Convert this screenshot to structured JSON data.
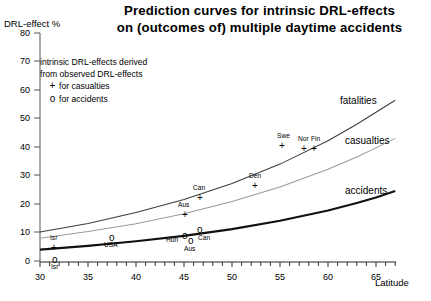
{
  "chart_data": {
    "type": "line",
    "title": "Prediction curves for intrinsic DRL-effects on (outcomes of) multiple daytime accidents",
    "title_line1": "Prediction curves for intrinsic DRL-effects",
    "title_line2": "on (outcomes of) multiple daytime accidents",
    "xlabel": "Latitude",
    "ylabel": "DRL-effect %",
    "xlim": [
      30,
      67
    ],
    "ylim": [
      0,
      80
    ],
    "xticks": [
      30,
      35,
      40,
      45,
      50,
      55,
      60,
      65
    ],
    "yticks": [
      0,
      10,
      20,
      30,
      40,
      50,
      60,
      70,
      80
    ],
    "xtick_minor_step": 1,
    "grid": false,
    "legend_position": "upper-left-inside",
    "series": [
      {
        "name": "fatalities",
        "label": "fatalities",
        "style": "thin-line",
        "x": [
          30,
          35,
          40,
          45,
          50,
          55,
          60,
          63,
          65,
          67
        ],
        "values": [
          10.2,
          13.2,
          17.0,
          21.6,
          27.2,
          34.0,
          42.2,
          48.0,
          52.2,
          56.4
        ]
      },
      {
        "name": "casualties",
        "label": "casualties",
        "style": "light-line",
        "x": [
          30,
          35,
          40,
          45,
          50,
          55,
          60,
          63,
          65,
          67
        ],
        "values": [
          8.0,
          10.3,
          13.1,
          16.6,
          20.9,
          26.0,
          32.2,
          36.5,
          39.7,
          43.0
        ]
      },
      {
        "name": "accidents",
        "label": "accidents",
        "style": "thick-line",
        "x": [
          30,
          35,
          40,
          45,
          50,
          55,
          60,
          63,
          65,
          67
        ],
        "values": [
          4.0,
          5.3,
          6.9,
          8.8,
          11.2,
          14.1,
          17.7,
          20.3,
          22.3,
          24.6
        ]
      }
    ],
    "points_casualties": [
      {
        "label": "Isr",
        "x": 31.8,
        "y": 8.5
      },
      {
        "label": "Aus",
        "x": 45.3,
        "y": 24.0
      },
      {
        "label": "Can",
        "x": 46.8,
        "y": 30.0
      },
      {
        "label": "Den",
        "x": 56.3,
        "y": 29.2
      },
      {
        "label": "Swe",
        "x": 59.3,
        "y": 42.0
      },
      {
        "label": "Nor",
        "x": 61.5,
        "y": 41.0
      },
      {
        "label": "Fin",
        "x": 62.5,
        "y": 41.0
      }
    ],
    "points_accidents": [
      {
        "label": "Isr",
        "x": 31.8,
        "y": 4.0
      },
      {
        "label": "USA",
        "x": 39.6,
        "y": 12.5
      },
      {
        "label": "Hun",
        "x": 47.2,
        "y": 13.5
      },
      {
        "label": "Aus",
        "x": 47.8,
        "y": 11.5
      },
      {
        "label": "Can",
        "x": 48.9,
        "y": 15.0
      }
    ]
  },
  "legend": {
    "line1": "intrinsic DRL-effects derived",
    "line2": "from observed DRL-effects",
    "casualties_marker": "+",
    "casualties_text": "for casualties",
    "accidents_marker": "o",
    "accidents_text": "for accidents"
  },
  "axis_labels": {
    "y_title": "DRL-effect %",
    "x_title": "Latitude"
  }
}
